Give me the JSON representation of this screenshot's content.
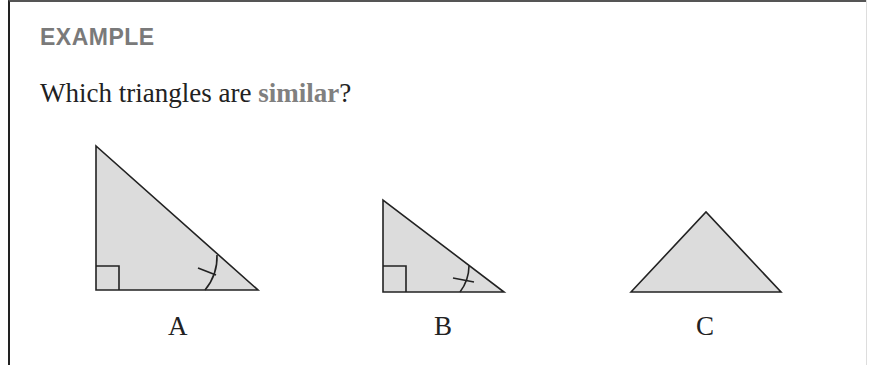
{
  "heading": "EXAMPLE",
  "question": {
    "before": "Which triangles are ",
    "keyword": "similar",
    "after": "?"
  },
  "colors": {
    "heading": "#7a7a7a",
    "keyword": "#808080",
    "triangle_fill": "#dcdcdc",
    "stroke": "#222222"
  },
  "triangles": [
    {
      "label": "A",
      "type": "right",
      "marks": [
        "right-angle",
        "angle-arc-tick"
      ]
    },
    {
      "label": "B",
      "type": "right",
      "marks": [
        "right-angle",
        "angle-arc-tick"
      ]
    },
    {
      "label": "C",
      "type": "isosceles",
      "marks": []
    }
  ]
}
